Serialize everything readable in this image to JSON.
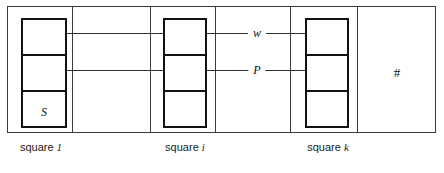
{
  "figure": {
    "kind": "tape-diagram",
    "background_color": "#ffffff",
    "frame_color": "#3a3a3a",
    "stack_color": "#111111",
    "line_color": "#2f2f2f"
  },
  "squares": [
    {
      "caption_prefix": "square",
      "caption_index": "1",
      "cell_labels": [
        "",
        "",
        "S"
      ]
    },
    {
      "caption_prefix": "square",
      "caption_index": "i",
      "cell_labels": [
        "",
        "",
        ""
      ]
    },
    {
      "caption_prefix": "square",
      "caption_index": "k",
      "cell_labels": [
        "",
        "",
        ""
      ]
    }
  ],
  "captions": {
    "square_1": "square 1",
    "square_i": "square i",
    "square_k": "square k",
    "square_1_prefix": "square",
    "square_1_index": "1",
    "square_i_prefix": "square",
    "square_i_index": "i",
    "square_k_prefix": "square",
    "square_k_index": "k"
  },
  "connectors": [
    {
      "name": "w-connector",
      "label": "w",
      "left_arrow": "left",
      "right_arrow": "right"
    },
    {
      "name": "p-connector",
      "label": "P",
      "left_arrow": "left",
      "right_arrow": "right"
    }
  ],
  "labels": {
    "w": "w",
    "p": "P",
    "s": "S",
    "blank": "#"
  }
}
